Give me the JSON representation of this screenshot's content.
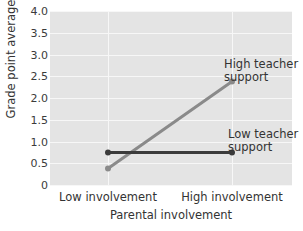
{
  "chart_data": {
    "type": "line",
    "title": "",
    "xlabel": "Parental involvement",
    "ylabel": "Grade point average",
    "categories": [
      "Low involvement",
      "High involvement"
    ],
    "x": [
      0,
      1
    ],
    "ylim": [
      0,
      4.0
    ],
    "yticks": [
      0,
      0.5,
      1.0,
      1.5,
      2.0,
      2.5,
      3.0,
      3.5,
      4.0
    ],
    "ytick_labels": [
      "0",
      "0.5",
      "1.0",
      "1.5",
      "2.0",
      "2.5",
      "3.0",
      "3.5",
      "4.0"
    ],
    "grid": "horizontal-and-vertical",
    "legend_position": "inline-annotations",
    "series": [
      {
        "name": "High teacher support",
        "values": [
          0.38,
          2.38
        ],
        "color": "#8a8a8a",
        "markers": true
      },
      {
        "name": "Low teacher support",
        "values": [
          0.75,
          0.75
        ],
        "color": "#3b3b3b",
        "markers": true
      }
    ],
    "annotations": [
      {
        "id": "high",
        "line1": "High teacher",
        "line2": "support"
      },
      {
        "id": "low",
        "line1": "Low teacher",
        "line2": "support"
      }
    ]
  },
  "colors": {
    "panel_background": "#e4e4e4",
    "gridline": "#f7f7f7",
    "page_background": "#ffffff",
    "text": "#333333",
    "high_support_line": "#8a8a8a",
    "low_support_line": "#3b3b3b"
  }
}
